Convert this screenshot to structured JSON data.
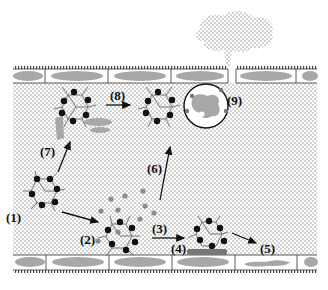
{
  "diagram": {
    "colors": {
      "background": "#ffffff",
      "lumen_dot": "#9a9a9a",
      "cell_fill": "#a8a8a8",
      "cell_border": "#333333",
      "particle_core": "#111111",
      "particle_ligand": "#777777",
      "protein": "#8c8c8c",
      "arrow": "#111111"
    },
    "labels": [
      {
        "id": "1",
        "text": "(1)",
        "x": 6,
        "y": 222
      },
      {
        "id": "2",
        "text": "(2)",
        "x": 80,
        "y": 244
      },
      {
        "id": "3",
        "text": "(3)",
        "x": 152,
        "y": 233
      },
      {
        "id": "4",
        "text": "(4)",
        "x": 171,
        "y": 253
      },
      {
        "id": "5",
        "text": "(5)",
        "x": 260,
        "y": 253
      },
      {
        "id": "6",
        "text": "(6)",
        "x": 147,
        "y": 173
      },
      {
        "id": "7",
        "text": "(7)",
        "x": 40,
        "y": 156
      },
      {
        "id": "8",
        "text": "(8)",
        "x": 110,
        "y": 100
      },
      {
        "id": "9",
        "text": "(9)",
        "x": 227,
        "y": 105
      }
    ]
  }
}
